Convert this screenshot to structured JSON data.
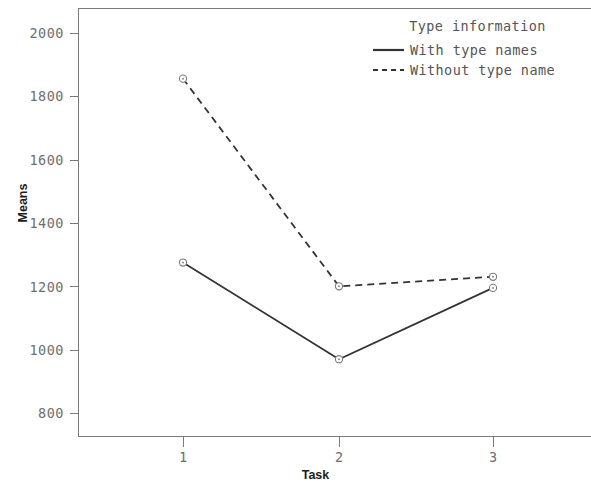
{
  "chart_data": {
    "type": "line",
    "title": "",
    "xlabel": "Task",
    "ylabel": "Means",
    "categories": [
      "1",
      "2",
      "3"
    ],
    "x": [
      1,
      2,
      3
    ],
    "xlim": [
      0.6,
      3.4
    ],
    "ylim": [
      770,
      2070
    ],
    "yticks": [
      800,
      1000,
      1200,
      1400,
      1600,
      1800,
      2000
    ],
    "ytick_labels": [
      "800",
      "1000",
      "1200",
      "1400",
      "1600",
      "1800",
      "2000"
    ],
    "xticks": [
      1,
      2,
      3
    ],
    "xtick_labels": [
      "1",
      "2",
      "3"
    ],
    "grid": false,
    "legend_position": "top-right",
    "legend_title": "Type information",
    "marker": "open-circle",
    "series": [
      {
        "name": "With type names",
        "style": "solid",
        "color": "#333333",
        "values": [
          1275,
          970,
          1195
        ]
      },
      {
        "name": "Without type name",
        "style": "dashed",
        "color": "#333333",
        "values": [
          1855,
          1200,
          1230
        ]
      }
    ]
  },
  "axes": {
    "y_title": "Means",
    "x_title": "Task",
    "y_tick_labels": [
      "2000",
      "1800",
      "1600",
      "1400",
      "1200",
      "1000",
      "800"
    ],
    "x_tick_labels": [
      "1",
      "2",
      "3"
    ]
  },
  "legend": {
    "title": "Type information",
    "entries": [
      {
        "label": "With type names",
        "style": "solid"
      },
      {
        "label": "Without type name",
        "style": "dashed"
      }
    ]
  },
  "colors": {
    "axis": "#7a7a7a",
    "tick_text": "#6f6f6f",
    "title_text": "#1c1c1c",
    "legend_text": "#555555",
    "series_line": "#333333",
    "background": "#ffffff"
  }
}
